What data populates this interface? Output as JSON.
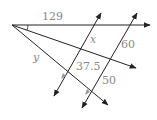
{
  "diagram": {
    "type": "geometry-parallel-lines-proportion",
    "labels": {
      "top_segment": "129",
      "x": "x",
      "right_upper": "60",
      "y": "y",
      "middle": "37.5",
      "right_lower": "50"
    },
    "colors": {
      "line": "#222222",
      "label": "#888888",
      "marker": "#999999"
    }
  }
}
